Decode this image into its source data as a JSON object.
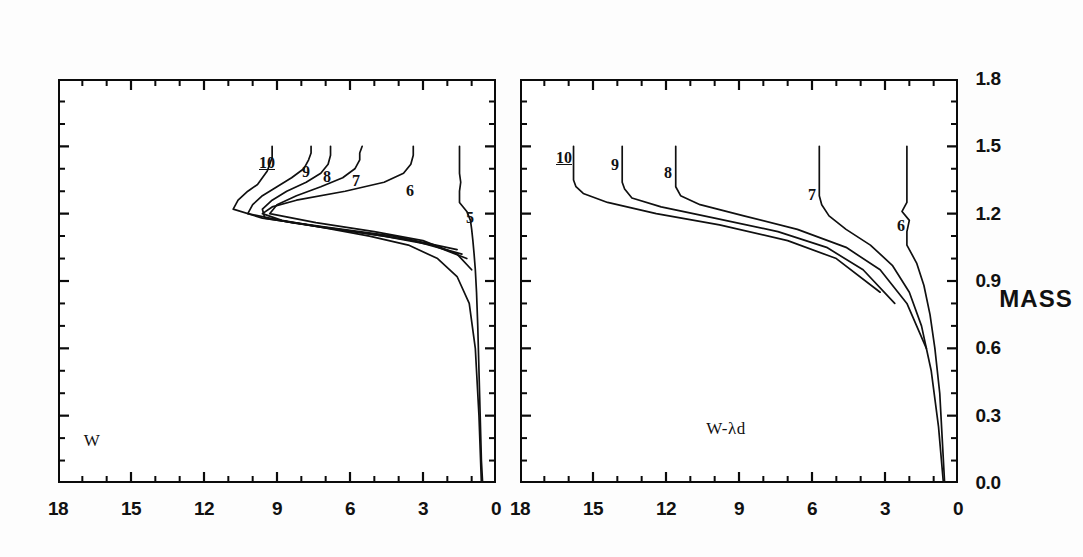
{
  "figure": {
    "orientation": "rotated-90-ccw",
    "axis_title_x": "MASS",
    "panels": [
      {
        "id": "top",
        "label": "W",
        "y_ticks": [
          "0",
          "3",
          "6",
          "9",
          "12",
          "15",
          "18"
        ],
        "curve_labels": [
          "5",
          "6",
          "7",
          "8",
          "9",
          "10"
        ]
      },
      {
        "id": "bottom",
        "label": "W-λd",
        "y_ticks": [
          "0",
          "3",
          "6",
          "9",
          "12",
          "15",
          "18"
        ],
        "curve_labels": [
          "6",
          "7",
          "8",
          "9",
          "10"
        ]
      }
    ],
    "x_ticks": [
      "0.0",
      "0.3",
      "0.6",
      "0.9",
      "1.2",
      "1.5",
      "1.8"
    ]
  },
  "chart_data": {
    "type": "line",
    "title": "",
    "subtitle": "",
    "xlabel": "MASS",
    "ylabel": "",
    "xlim": [
      0.0,
      1.8
    ],
    "ylim": [
      0,
      18
    ],
    "xticks": [
      0.0,
      0.3,
      0.6,
      0.9,
      1.2,
      1.5,
      1.8
    ],
    "yticks": [
      0,
      3,
      6,
      9,
      12,
      15,
      18
    ],
    "grid": false,
    "legend": "none",
    "minor_ticks_per_interval": 2,
    "panels": [
      {
        "name": "W",
        "annotation": "W",
        "series": [
          {
            "name": "5",
            "label": "5",
            "x": [
              0.0,
              0.1,
              0.3,
              0.5,
              0.7,
              0.85,
              0.95,
              1.02,
              1.08,
              1.13,
              1.17,
              1.21,
              1.25,
              1.3,
              1.34,
              1.38,
              1.41,
              1.44,
              1.47,
              1.5
            ],
            "values": [
              0.55,
              0.6,
              0.65,
              0.7,
              0.75,
              0.8,
              0.85,
              0.9,
              0.95,
              1.0,
              1.05,
              1.2,
              1.5,
              1.5,
              1.45,
              1.5,
              1.5,
              1.5,
              1.5,
              1.5
            ]
          },
          {
            "name": "6",
            "label": "6",
            "x": [
              0.0,
              0.3,
              0.6,
              0.8,
              0.92,
              1.0,
              1.06,
              1.1,
              1.14,
              1.17,
              1.2,
              1.23,
              1.26,
              1.3,
              1.34,
              1.38,
              1.42,
              1.46,
              1.5
            ],
            "values": [
              0.6,
              0.7,
              0.85,
              1.1,
              1.6,
              2.4,
              3.6,
              5.2,
              7.2,
              8.8,
              9.6,
              9.2,
              8.2,
              6.2,
              4.6,
              3.8,
              3.5,
              3.4,
              3.4
            ]
          },
          {
            "name": "7",
            "label": "7",
            "x": [
              0.95,
              1.02,
              1.08,
              1.12,
              1.16,
              1.2,
              1.24,
              1.28,
              1.32,
              1.36,
              1.4,
              1.44,
              1.47,
              1.5
            ],
            "values": [
              1.0,
              1.6,
              3.0,
              5.0,
              7.4,
              9.3,
              9.0,
              8.2,
              7.2,
              6.3,
              5.8,
              5.6,
              5.6,
              5.5
            ]
          },
          {
            "name": "8",
            "label": "8",
            "x": [
              1.0,
              1.06,
              1.1,
              1.14,
              1.18,
              1.22,
              1.26,
              1.3,
              1.34,
              1.38,
              1.42,
              1.46,
              1.5
            ],
            "values": [
              1.2,
              2.6,
              4.6,
              7.2,
              9.5,
              9.6,
              9.2,
              8.6,
              7.8,
              7.2,
              6.9,
              6.8,
              6.8
            ]
          },
          {
            "name": "9",
            "label": "9",
            "x": [
              1.02,
              1.08,
              1.12,
              1.16,
              1.2,
              1.24,
              1.28,
              1.32,
              1.36,
              1.4,
              1.44,
              1.47,
              1.5
            ],
            "values": [
              1.4,
              3.4,
              5.8,
              8.4,
              10.2,
              10.0,
              9.6,
              9.0,
              8.4,
              7.9,
              7.7,
              7.6,
              7.6
            ]
          },
          {
            "name": "10",
            "label": "10",
            "x": [
              1.04,
              1.1,
              1.14,
              1.18,
              1.22,
              1.26,
              1.3,
              1.33,
              1.36,
              1.39,
              1.42,
              1.45,
              1.48,
              1.5
            ],
            "values": [
              1.6,
              4.2,
              7.0,
              9.6,
              10.8,
              10.6,
              10.2,
              9.8,
              9.6,
              9.4,
              9.3,
              9.2,
              9.2,
              9.2
            ]
          }
        ]
      },
      {
        "name": "W-λd",
        "annotation": "W-λd",
        "series": [
          {
            "name": "6",
            "label": "6",
            "x": [
              0.0,
              0.2,
              0.4,
              0.6,
              0.75,
              0.88,
              0.98,
              1.06,
              1.12,
              1.17,
              1.21,
              1.25,
              1.28,
              1.31,
              1.34,
              1.37,
              1.4,
              1.43,
              1.46,
              1.5
            ],
            "values": [
              0.55,
              0.65,
              0.75,
              0.95,
              1.15,
              1.4,
              1.7,
              2.1,
              2.1,
              2.0,
              2.3,
              2.1,
              2.1,
              2.1,
              2.1,
              2.1,
              2.1,
              2.1,
              2.1,
              2.1
            ]
          },
          {
            "name": "7",
            "label": "7",
            "x": [
              0.0,
              0.25,
              0.5,
              0.7,
              0.85,
              0.97,
              1.06,
              1.13,
              1.19,
              1.24,
              1.28,
              1.31,
              1.34,
              1.37,
              1.4,
              1.43,
              1.46,
              1.5
            ],
            "values": [
              0.6,
              0.8,
              1.1,
              1.5,
              2.0,
              2.7,
              3.6,
              4.6,
              5.3,
              5.6,
              5.7,
              5.7,
              5.7,
              5.7,
              5.7,
              5.7,
              5.7,
              5.7
            ]
          },
          {
            "name": "8",
            "label": "8",
            "x": [
              0.6,
              0.8,
              0.95,
              1.05,
              1.13,
              1.19,
              1.24,
              1.28,
              1.32,
              1.36,
              1.39,
              1.42,
              1.45,
              1.48,
              1.5
            ],
            "values": [
              1.3,
              2.1,
              3.2,
              4.6,
              6.6,
              8.8,
              10.6,
              11.4,
              11.6,
              11.6,
              11.6,
              11.6,
              11.6,
              11.6,
              11.6
            ]
          },
          {
            "name": "9",
            "label": "9",
            "x": [
              0.8,
              0.95,
              1.05,
              1.12,
              1.18,
              1.23,
              1.27,
              1.31,
              1.34,
              1.37,
              1.4,
              1.43,
              1.46,
              1.48,
              1.5
            ],
            "values": [
              2.6,
              3.9,
              5.4,
              7.4,
              10.0,
              12.2,
              13.4,
              13.7,
              13.8,
              13.8,
              13.8,
              13.8,
              13.8,
              13.8,
              13.8
            ]
          },
          {
            "name": "10",
            "label": "10",
            "x": [
              0.85,
              1.0,
              1.08,
              1.15,
              1.2,
              1.25,
              1.29,
              1.32,
              1.35,
              1.38,
              1.41,
              1.44,
              1.47,
              1.5
            ],
            "values": [
              3.2,
              5.0,
              7.0,
              9.8,
              12.4,
              14.4,
              15.4,
              15.7,
              15.8,
              15.8,
              15.8,
              15.8,
              15.8,
              15.8
            ]
          }
        ]
      }
    ]
  }
}
